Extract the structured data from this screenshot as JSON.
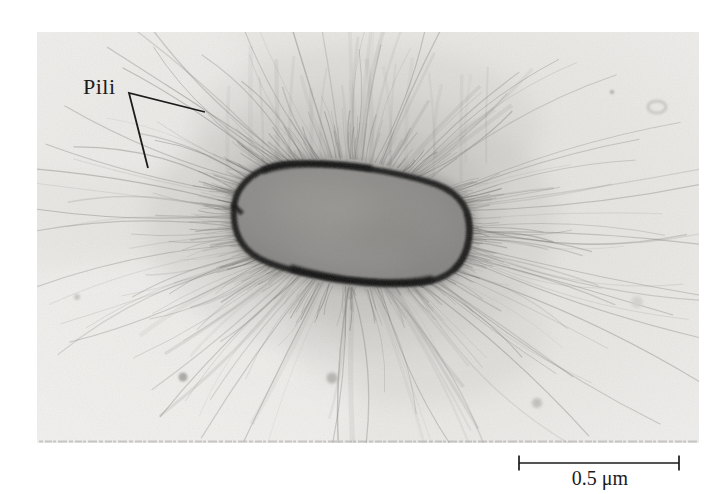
{
  "figure": {
    "pili_label": "Pili",
    "scale_bar": {
      "label": "0.5 μm",
      "value": "0.5",
      "unit": "μm"
    },
    "colors": {
      "page_background": "#ffffff",
      "photo_background": "#e9e8e5",
      "cell_body": "#8b8a88",
      "cell_outline": "#1b1b1a",
      "pili": "#6f6e6a",
      "annotation_text": "#1b1b1b"
    }
  }
}
